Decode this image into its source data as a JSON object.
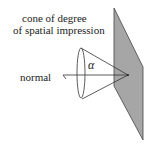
{
  "diagram": {
    "title_line1": "cone of degree",
    "title_line2": "of spatial impression",
    "normal_label": "normal",
    "angle_label": "α",
    "colors": {
      "plane_fill": "#a6a6a6",
      "stroke": "#333333",
      "text": "#222222"
    }
  }
}
